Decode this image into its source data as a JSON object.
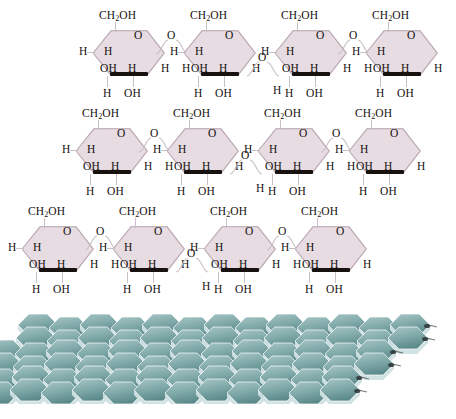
{
  "figure": {
    "background_color": "#ffffff",
    "caption_visible": false,
    "caption_note": "clipped/illegible text strip at bottom edge"
  },
  "colors": {
    "ring_fill": "#e6dce2",
    "ring_stroke": "#b9a7b0",
    "front_edge": "#17110f",
    "bond": "#c9bfc4",
    "text": "#16110f",
    "fibril_face_light": "#a8c6c6",
    "fibril_face_mid": "#7fa8a8",
    "fibril_face_dark": "#5d8b8c",
    "fibril_side": "#cfe0e2",
    "fibril_node": "#2e3436"
  },
  "labels": {
    "ch2oh": "CH",
    "ch2oh_sub": "2",
    "ch2oh_tail": "OH",
    "hydrogen": "H",
    "hydroxyl": "OH",
    "oxygen": "O"
  },
  "chart_data": {
    "type": "diagram",
    "rows": [
      {
        "index": 0,
        "left": 85,
        "top": 8,
        "ring_count": 4,
        "rings": [
          {
            "ch2oh": "CH2OH",
            "ring_o": "O",
            "left_h": "H",
            "upper_inner_h": "H",
            "lower_oh": "OH",
            "lower_inner_h": "H",
            "bottom_h": "H",
            "bottom_oh": "OH",
            "right_tail": "H",
            "bridge_after": "upper"
          },
          {
            "ch2oh": "CH2OH",
            "ring_o": "O",
            "left_h": "H",
            "upper_inner_h": "H",
            "lower_oh": "OH",
            "lower_inner_h": "H",
            "bottom_h": "H",
            "bottom_oh": "OH",
            "right_tail": "H",
            "bridge_after": "lower"
          },
          {
            "ch2oh": "CH2OH",
            "ring_o": "O",
            "left_h": "H",
            "upper_inner_h": "H",
            "lower_oh": "OH",
            "lower_inner_h": "H",
            "bottom_h": "H",
            "bottom_oh": "OH",
            "right_tail": "H",
            "bridge_after": "upper"
          },
          {
            "ch2oh": "CH2OH",
            "ring_o": "O",
            "left_h": "H",
            "upper_inner_h": "H",
            "lower_oh": "OH",
            "lower_inner_h": "H",
            "bottom_h": "H",
            "bottom_oh": "OH",
            "right_tail": "H",
            "bridge_after": "none"
          }
        ]
      },
      {
        "index": 1,
        "left": 68,
        "top": 106,
        "ring_count": 4,
        "rings": [
          {
            "ch2oh": "CH2OH",
            "ring_o": "O",
            "left_h": "H",
            "upper_inner_h": "H",
            "lower_oh": "OH",
            "lower_inner_h": "H",
            "bottom_h": "H",
            "bottom_oh": "OH",
            "right_tail": "H",
            "bridge_after": "upper"
          },
          {
            "ch2oh": "CH2OH",
            "ring_o": "O",
            "left_h": "H",
            "upper_inner_h": "H",
            "lower_oh": "OH",
            "lower_inner_h": "H",
            "bottom_h": "H",
            "bottom_oh": "OH",
            "right_tail": "H",
            "bridge_after": "lower"
          },
          {
            "ch2oh": "CH2OH",
            "ring_o": "O",
            "left_h": "H",
            "upper_inner_h": "H",
            "lower_oh": "OH",
            "lower_inner_h": "H",
            "bottom_h": "H",
            "bottom_oh": "OH",
            "right_tail": "H",
            "bridge_after": "upper"
          },
          {
            "ch2oh": "CH2OH",
            "ring_o": "O",
            "left_h": "H",
            "upper_inner_h": "H",
            "lower_oh": "OH",
            "lower_inner_h": "H",
            "bottom_h": "H",
            "bottom_oh": "OH",
            "right_tail": "H",
            "bridge_after": "none"
          }
        ]
      },
      {
        "index": 2,
        "left": 14,
        "top": 204,
        "ring_count": 4,
        "rings": [
          {
            "ch2oh": "CH2OH",
            "ring_o": "O",
            "left_h": "H",
            "upper_inner_h": "H",
            "lower_oh": "OH",
            "lower_inner_h": "H",
            "bottom_h": "H",
            "bottom_oh": "OH",
            "right_tail": "H",
            "bridge_after": "upper"
          },
          {
            "ch2oh": "CH2OH",
            "ring_o": "O",
            "left_h": "H",
            "upper_inner_h": "H",
            "lower_oh": "OH",
            "lower_inner_h": "H",
            "bottom_h": "H",
            "bottom_oh": "OH",
            "right_tail": "H",
            "bridge_after": "lower"
          },
          {
            "ch2oh": "CH2OH",
            "ring_o": "O",
            "left_h": "H",
            "upper_inner_h": "H",
            "lower_oh": "OH",
            "lower_inner_h": "H",
            "bottom_h": "H",
            "bottom_oh": "OH",
            "right_tail": "H",
            "bridge_after": "upper"
          },
          {
            "ch2oh": "CH2OH",
            "ring_o": "O",
            "left_h": "H",
            "upper_inner_h": "H",
            "lower_oh": "OH",
            "lower_inner_h": "H",
            "bottom_h": "H",
            "bottom_oh": "OH",
            "right_tail": "H",
            "bridge_after": "none"
          }
        ]
      }
    ],
    "microfibril": {
      "top": 308,
      "height": 96,
      "columns": 13,
      "rows": 6,
      "plate_shape": "hexagonal-3d",
      "description": "stacked teal hexagonal plates forming a sheet lattice with dark node connectors"
    }
  }
}
